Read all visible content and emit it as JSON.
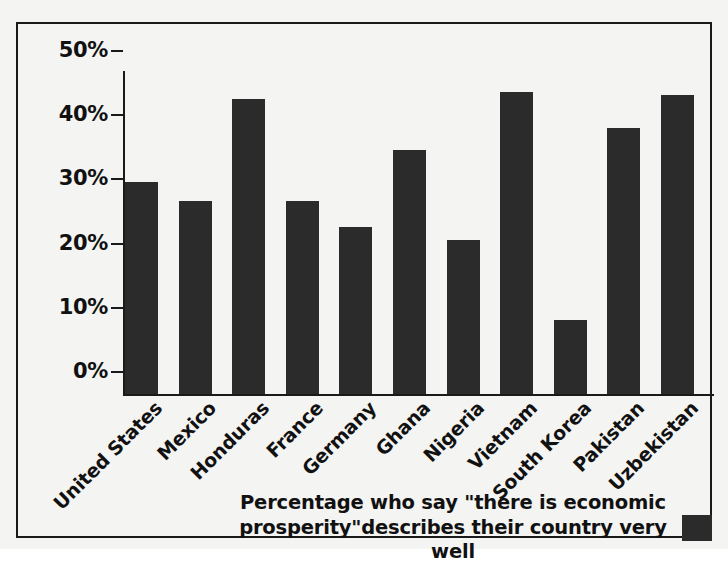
{
  "chart_data": {
    "type": "bar",
    "title": "",
    "subtitle": "",
    "xlabel": "",
    "ylabel": "",
    "ylim": [
      0,
      50
    ],
    "grid": false,
    "legend_position": "bottom-right",
    "categories": [
      "United States",
      "Mexico",
      "Honduras",
      "France",
      "Germany",
      "Ghana",
      "Nigeria",
      "Vietnam",
      "South Korea",
      "Pakistan",
      "Uzbekistan"
    ],
    "values": [
      33,
      30,
      46,
      30,
      26,
      38,
      24,
      47,
      11.5,
      41.5,
      46.5
    ],
    "value_unit": "%",
    "series": [
      {
        "name": "Percentage who say \"there is economic prosperity\" describes their country very well",
        "color": "#2b2b2b",
        "values": [
          33,
          30,
          46,
          30,
          26,
          38,
          24,
          47,
          11.5,
          41.5,
          46.5
        ]
      }
    ],
    "y_ticks": [
      {
        "value": 50,
        "label": "50%"
      },
      {
        "value": 40,
        "label": "40%"
      },
      {
        "value": 30,
        "label": "30%"
      },
      {
        "value": 20,
        "label": "20%"
      },
      {
        "value": 10,
        "label": "10%"
      },
      {
        "value": 0,
        "label": "0%"
      }
    ],
    "legend": {
      "line1": "Percentage who say \"there is economic",
      "line2": "prosperity\"describes their country very well",
      "swatch_color": "#2b2b2b"
    },
    "colors": {
      "bar": "#2b2b2b",
      "axis": "#1a1a1a",
      "text": "#111111",
      "background": "#f4f4f2",
      "frame": "#1a1a1a"
    }
  }
}
